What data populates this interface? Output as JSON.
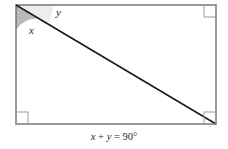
{
  "figure": {
    "type": "geometry-diagram",
    "shape": "rectangle-with-diagonal",
    "rectangle": {
      "left": 16,
      "top": 5,
      "right": 216,
      "bottom": 124,
      "width": 200,
      "height": 119,
      "stroke_color": "#6e6e6e",
      "fill_color": "#ffffff",
      "stroke_width": 1.4
    },
    "diagonal": {
      "from": "top-left",
      "to": "bottom-right",
      "x1": 16,
      "y1": 5,
      "x2": 216,
      "y2": 124,
      "stroke_color": "#1a1a1a",
      "stroke_width": 1.6
    },
    "angles": [
      {
        "name": "x",
        "label": "x",
        "vertex": "top-left",
        "between": [
          "left-side",
          "diagonal"
        ],
        "sector_radius": 25,
        "fill_color": "#b9b9b9",
        "label_x": 29,
        "label_y": 25
      },
      {
        "name": "y",
        "label": "y",
        "vertex": "top-left",
        "between": [
          "diagonal",
          "top-side"
        ],
        "sector_radius": 37,
        "fill_color": "#ededed",
        "label_x": 56,
        "label_y": 7
      }
    ],
    "right_angle_markers": [
      {
        "corner": "top-right",
        "x": 204,
        "y": 5,
        "size": 12
      },
      {
        "corner": "bottom-left",
        "x": 16,
        "y": 112,
        "size": 12
      },
      {
        "corner": "bottom-right",
        "x": 204,
        "y": 112,
        "size": 12
      }
    ],
    "marker_stroke_color": "#9a9a9a"
  },
  "caption": {
    "full_text": "x + y = 90°",
    "term_x": "x",
    "plus": " + ",
    "term_y": "y",
    "equals": " = ",
    "value": "90°"
  }
}
